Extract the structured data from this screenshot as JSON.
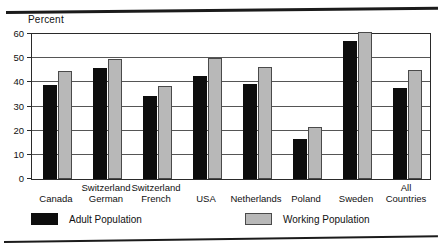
{
  "chart_data": {
    "type": "bar",
    "title": "",
    "xlabel": "",
    "ylabel": "Percent",
    "ylim": [
      0,
      60
    ],
    "yticks": [
      0,
      10,
      20,
      30,
      40,
      50,
      60
    ],
    "grid": true,
    "legend_position": "bottom",
    "categories": [
      "Canada",
      "Switzerland German",
      "Switzerland French",
      "USA",
      "Netherlands",
      "Poland",
      "Sweden",
      "All Countries"
    ],
    "category_lines": [
      [
        "Canada"
      ],
      [
        "Switzerland",
        "German"
      ],
      [
        "Switzerland",
        "French"
      ],
      [
        "USA"
      ],
      [
        "Netherlands"
      ],
      [
        "Poland"
      ],
      [
        "Sweden"
      ],
      [
        "All",
        "Countries"
      ]
    ],
    "series": [
      {
        "name": "Adult Population",
        "color": "#0d0d0d",
        "values": [
          39,
          46,
          34.5,
          42.5,
          39.5,
          16.5,
          57,
          37.5
        ]
      },
      {
        "name": "Working Population",
        "color": "#b8b8b8",
        "values": [
          44.5,
          49.5,
          38.5,
          50,
          46.5,
          21.5,
          61,
          45
        ]
      }
    ]
  }
}
